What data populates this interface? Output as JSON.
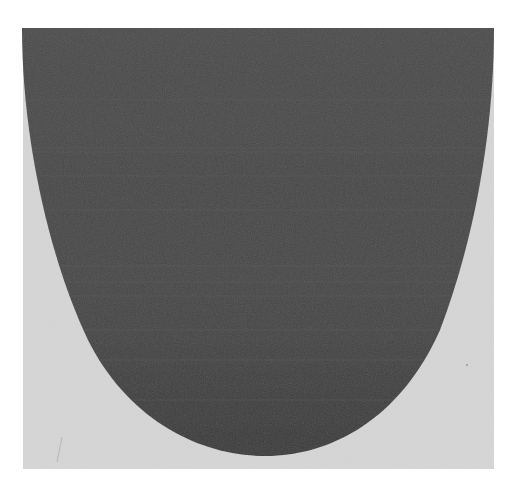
{
  "image": {
    "description": "Abstract minimalist artwork: dark grey U-shaped half-ellipse on a light grey square panel, on a white background",
    "colors": {
      "background": "#ffffff",
      "panel": "#d6d6d6",
      "shape": "#4a4a4a",
      "streak": "#5a5a5a"
    },
    "panel": {
      "x": 23,
      "y": 28,
      "width": 471,
      "height": 441
    },
    "shape": {
      "top_y": 28,
      "top_left_x": 22,
      "top_right_x": 494,
      "bottom_y": 456,
      "bottom_center_x": 265
    }
  }
}
